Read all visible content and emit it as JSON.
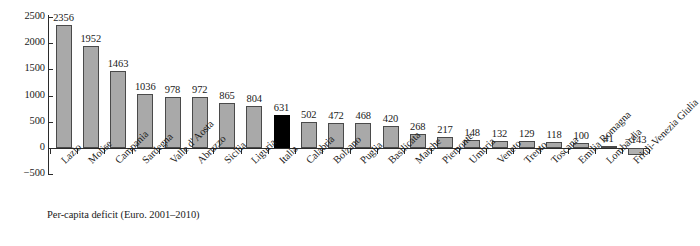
{
  "chart_data": {
    "type": "bar",
    "title": "",
    "subtitle": "",
    "caption": "Per-capita deficit (Euro. 2001–2010)",
    "xlabel": "",
    "ylabel": "",
    "ylim": [
      -500,
      2500
    ],
    "ytick_values": [
      2500,
      2000,
      1500,
      1000,
      500,
      0,
      -500
    ],
    "ytick_labels": [
      "2500",
      "2000",
      "1500",
      "1000",
      "500",
      "0",
      "−500"
    ],
    "grid": false,
    "legend": "none",
    "highlight_category": "Italia",
    "highlight_color": "#000000",
    "bar_color": "#a9a9a9",
    "bar_border_color": "#4a4a4a",
    "axis_color": "#2b2b2b",
    "categories": [
      "Lazio",
      "Molise",
      "Campania",
      "Sardegna",
      "Valle d' Aosta",
      "Abruzzo",
      "Sicilia",
      "Liguria",
      "Italia",
      "Calabria",
      "Bolzano",
      "Puglia",
      "Basilicata",
      "Marche",
      "Piemonte",
      "Umbria",
      "Veneto",
      "Trento",
      "Toscana",
      "Emilia Romagna",
      "Lombardia",
      "Friuli-Venezia Giulia"
    ],
    "values": [
      2356,
      1952,
      1463,
      1036,
      978,
      972,
      865,
      804,
      631,
      502,
      472,
      468,
      420,
      268,
      217,
      148,
      132,
      129,
      118,
      100,
      41,
      -143
    ],
    "value_labels": [
      "2356",
      "1952",
      "1463",
      "1036",
      "978",
      "972",
      "865",
      "804",
      "631",
      "502",
      "472",
      "468",
      "420",
      "268",
      "217",
      "148",
      "132",
      "129",
      "118",
      "100",
      "41",
      "−143"
    ]
  }
}
